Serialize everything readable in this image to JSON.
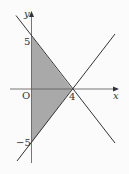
{
  "figure": {
    "axes": {
      "x_label": "x",
      "y_label": "y",
      "origin_label": "O"
    },
    "tick_labels": {
      "y_pos": "5",
      "y_neg": "−5",
      "x_pos": "4"
    },
    "colors": {
      "line": "#333333",
      "axis": "#555555",
      "shade": "#a9a9a9",
      "background": "#fbfbfb"
    },
    "shaded_region_vertices": [
      [
        0,
        5
      ],
      [
        4,
        0
      ],
      [
        0,
        -5
      ]
    ],
    "lines": [
      {
        "name": "line-decreasing",
        "equation": "y = -5/4 x + 5"
      },
      {
        "name": "line-increasing",
        "equation": "y = 5/4 x - 5"
      }
    ]
  }
}
